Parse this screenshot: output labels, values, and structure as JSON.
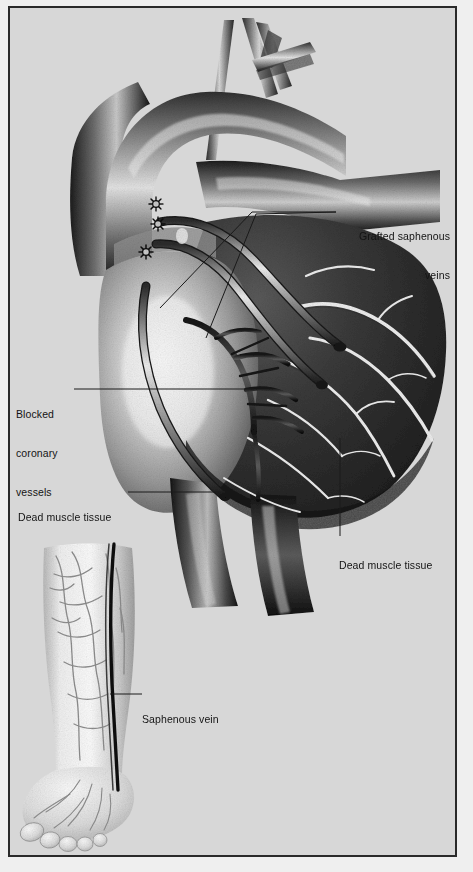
{
  "figure": {
    "kind": "medical-illustration",
    "background_color": "#d7d7d7",
    "border_color": "#2a2a2a",
    "ink_color": "#141414"
  },
  "labels": [
    {
      "id": "grafted-saphenous-veins",
      "text_lines": [
        "Grafted saphenous",
        "veins"
      ],
      "align": "right",
      "x": 334,
      "y": 196
    },
    {
      "id": "blocked-coronary-vessels",
      "text_lines": [
        "Blocked",
        "coronary",
        "vessels"
      ],
      "align": "left",
      "x": 14,
      "y": 374
    },
    {
      "id": "dead-muscle-tissue-left",
      "text_lines": [
        "Dead muscle tissue"
      ],
      "align": "left",
      "x": 16,
      "y": 478
    },
    {
      "id": "dead-muscle-tissue-right",
      "text_lines": [
        "Dead muscle tissue"
      ],
      "align": "left",
      "x": 337,
      "y": 526
    },
    {
      "id": "saphenous-vein",
      "text_lines": [
        "Saphenous vein"
      ],
      "align": "left",
      "x": 140,
      "y": 680
    }
  ],
  "anatomy": {
    "heart": {
      "name": "heart",
      "parts": [
        "ascending aorta",
        "aortic arch",
        "brachiocephalic trunk",
        "left common carotid artery",
        "left subclavian artery",
        "pulmonary trunk",
        "superior vena cava",
        "inferior vena cava",
        "right ventricle",
        "left ventricle",
        "coronary arteries",
        "grafted saphenous vein segments",
        "suture anastomoses"
      ],
      "graft_count": 3,
      "suture_marks": 3,
      "infarct_region": "right and inferior wall, darkly shaded"
    },
    "leg": {
      "name": "donor leg",
      "parts": [
        "lower leg",
        "ankle",
        "foot",
        "toes",
        "great saphenous vein",
        "superficial vein network"
      ],
      "highlighted_vessel": "great saphenous vein"
    }
  }
}
